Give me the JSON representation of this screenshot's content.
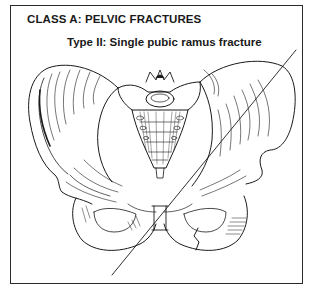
{
  "figure": {
    "heading": "CLASS A: PELVIC FRACTURES",
    "subtitle": "Type II: Single pubic ramus fracture",
    "illustration": "anterior-view-pelvis-line-drawing",
    "annotations": {
      "diagonal_line": {
        "x1": 296,
        "y1": 50,
        "x2": 112,
        "y2": 275
      },
      "fracture_site": "right-superior-pubic-ramus"
    },
    "colors": {
      "ink": "#1a1a1a",
      "border": "#2a2a2a",
      "background": "#ffffff"
    }
  }
}
